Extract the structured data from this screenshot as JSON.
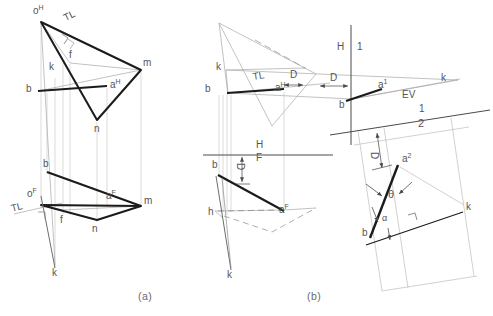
{
  "figure": {
    "captions": [
      {
        "text": "(a)",
        "x": 138,
        "y": 297
      },
      {
        "text": "(b)",
        "x": 307,
        "y": 297
      }
    ],
    "colors": {
      "heavy_line": "#1b1b1b",
      "light_line": "#9a9a9a",
      "very_light_line": "#bdbdbd",
      "text": "#555555",
      "background": "#ffffff"
    }
  },
  "panel_a": {
    "name": "Method (a) - line MNO and point rotation",
    "top_view": {
      "name": "horizontal-projection",
      "labels": [
        {
          "id": "o-h",
          "text": "o",
          "sup": "H",
          "x": 33,
          "y": 8
        },
        {
          "id": "tl-top",
          "text": "TL",
          "x": 60,
          "y": 17,
          "rotate": -26
        },
        {
          "id": "f-top",
          "text": "f",
          "x": 69,
          "y": 54
        },
        {
          "id": "k-top",
          "text": "k",
          "x": 49,
          "y": 66
        },
        {
          "id": "b-top",
          "text": "b",
          "x": 27,
          "y": 88
        },
        {
          "id": "a-h",
          "text": "a",
          "x": 110,
          "y": 84,
          "sup": "H"
        },
        {
          "id": "m-top",
          "text": "m",
          "x": 143,
          "y": 62
        },
        {
          "id": "n-top",
          "text": "n",
          "x": 95,
          "y": 128
        }
      ],
      "points": {
        "o": [
          41,
          22
        ],
        "m": [
          141,
          70
        ],
        "n": [
          97,
          120
        ],
        "b": [
          38,
          91
        ],
        "a": [
          107,
          86
        ],
        "f": [
          70,
          63
        ],
        "k": [
          55,
          265
        ]
      }
    },
    "front_view": {
      "name": "frontal-projection",
      "labels": [
        {
          "id": "b-front",
          "text": "b",
          "x": 44,
          "y": 163
        },
        {
          "id": "o-f",
          "text": "o",
          "sup": "F",
          "x": 28,
          "y": 193
        },
        {
          "id": "tl-front",
          "text": "TL",
          "x": 9,
          "y": 207,
          "rotate": -14
        },
        {
          "id": "f-front",
          "text": "f",
          "x": 60,
          "y": 219
        },
        {
          "id": "n-front",
          "text": "n",
          "x": 93,
          "y": 228
        },
        {
          "id": "a-f",
          "text": "a",
          "sup": "F",
          "x": 106,
          "y": 195
        },
        {
          "id": "m-front",
          "text": "m",
          "x": 144,
          "y": 200
        },
        {
          "id": "k-front",
          "text": "k",
          "x": 53,
          "y": 272
        }
      ],
      "points": {
        "o": [
          41,
          205
        ],
        "m": [
          141,
          206
        ],
        "n": [
          97,
          220
        ],
        "b": [
          47,
          172
        ],
        "a": [
          107,
          205
        ],
        "f": [
          63,
          210
        ]
      }
    }
  },
  "panel_b": {
    "name": "Method (b) - auxiliary views, edge view of plane",
    "top_view": {
      "name": "horizontal-projection-b",
      "labels": [
        {
          "id": "k-b-top",
          "text": "k",
          "x": 216,
          "y": 66
        },
        {
          "id": "b-b-top",
          "text": "b",
          "x": 206,
          "y": 88
        },
        {
          "id": "tl-b",
          "text": "TL",
          "x": 251,
          "y": 76,
          "rotate": -9
        },
        {
          "id": "a-h-b",
          "text": "a",
          "sup": "H",
          "x": 276,
          "y": 86
        },
        {
          "id": "d1",
          "text": "D",
          "x": 290,
          "y": 73
        },
        {
          "id": "d2",
          "text": "D",
          "x": 330,
          "y": 76
        }
      ]
    },
    "reference_lines": [
      {
        "id": "h-1-line",
        "upper": "H",
        "lower": "1",
        "upper_x": 344,
        "upper_y": 47,
        "lower_x": 358,
        "lower_y": 47,
        "orientation": "vertical"
      },
      {
        "id": "h-f-line",
        "upper": "H",
        "lower": "F",
        "upper_x": 257,
        "upper_y": 144,
        "lower_x": 257,
        "lower_y": 155,
        "orientation": "horizontal"
      },
      {
        "id": "1-2-line",
        "upper": "1",
        "lower": "2",
        "upper_x": 418,
        "upper_y": 108,
        "lower_x": 420,
        "lower_y": 122,
        "orientation": "oblique"
      }
    ],
    "aux_view_1": {
      "name": "first-auxiliary-view",
      "labels": [
        {
          "id": "a-1",
          "text": "a",
          "sup": "1",
          "x": 378,
          "y": 84
        },
        {
          "id": "b-aux1",
          "text": "b",
          "x": 340,
          "y": 103
        },
        {
          "id": "ev",
          "text": "EV",
          "x": 404,
          "y": 94
        },
        {
          "id": "k-aux1",
          "text": "k",
          "x": 442,
          "y": 77
        }
      ]
    },
    "front_view": {
      "name": "frontal-projection-b",
      "labels": [
        {
          "id": "b-front-b",
          "text": "b",
          "x": 213,
          "y": 164
        },
        {
          "id": "h-front-b",
          "text": "h",
          "x": 209,
          "y": 211
        },
        {
          "id": "a-f-b",
          "text": "a",
          "sup": "F",
          "x": 279,
          "y": 208
        },
        {
          "id": "k-front-b",
          "text": "k",
          "x": 228,
          "y": 274
        },
        {
          "id": "d-front",
          "text": "D",
          "x": 240,
          "y": 165,
          "rotate": 90
        }
      ]
    },
    "aux_view_2": {
      "name": "second-auxiliary-view",
      "labels": [
        {
          "id": "a-2",
          "text": "a",
          "sup": "2",
          "x": 403,
          "y": 158
        },
        {
          "id": "theta",
          "text": "θ",
          "x": 390,
          "y": 193
        },
        {
          "id": "alpha",
          "text": "α",
          "x": 383,
          "y": 218
        },
        {
          "id": "b-aux2",
          "text": "b",
          "x": 364,
          "y": 232
        },
        {
          "id": "k-aux2",
          "text": "k",
          "x": 467,
          "y": 206
        },
        {
          "id": "d-aux2",
          "text": "D",
          "x": 375,
          "y": 155,
          "rotate": 90
        }
      ]
    }
  }
}
